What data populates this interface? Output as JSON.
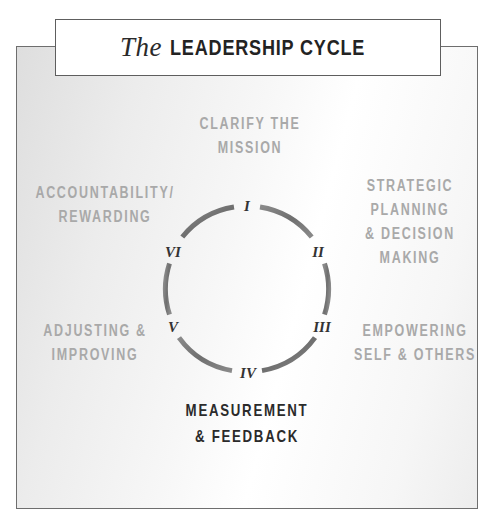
{
  "title": {
    "prefix": "The",
    "main": "LEADERSHIP CYCLE"
  },
  "stages": [
    {
      "numeral": "I",
      "lines": [
        "CLARIFY THE",
        "MISSION"
      ],
      "highlighted": false
    },
    {
      "numeral": "II",
      "lines": [
        "STRATEGIC",
        "PLANNING",
        "& DECISION",
        "MAKING"
      ],
      "highlighted": false
    },
    {
      "numeral": "III",
      "lines": [
        "EMPOWERING",
        "SELF & OTHERS"
      ],
      "highlighted": false
    },
    {
      "numeral": "IV",
      "lines": [
        "MEASUREMENT",
        "& FEEDBACK"
      ],
      "highlighted": true
    },
    {
      "numeral": "V",
      "lines": [
        "ADJUSTING &",
        "IMPROVING"
      ],
      "highlighted": false
    },
    {
      "numeral": "VI",
      "lines": [
        "ACCOUNTABILITY/",
        "REWARDING"
      ],
      "highlighted": false
    }
  ],
  "colors": {
    "muted_text": "#a9a9a9",
    "active_text": "#2b2b2b",
    "arc": "#7a7a7a",
    "border": "#6e6e6e"
  }
}
